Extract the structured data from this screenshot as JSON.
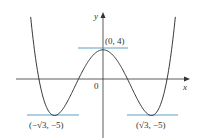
{
  "diagram": {
    "function": "y = x^4 - 6x^2 + 4",
    "axes": {
      "x_label": "x",
      "y_label": "y",
      "origin_label": "0"
    },
    "points": [
      {
        "label": "(0, 4)",
        "x": 0,
        "y": 4,
        "type": "local maximum"
      },
      {
        "label": "(−√3, −5)",
        "x": -1.732,
        "y": -5,
        "type": "local minimum"
      },
      {
        "label": "(√3, −5)",
        "x": 1.732,
        "y": -5,
        "type": "local minimum"
      }
    ],
    "colors": {
      "curve": "#222222",
      "tangent": "#5aa0c8",
      "axis": "#333333"
    }
  }
}
